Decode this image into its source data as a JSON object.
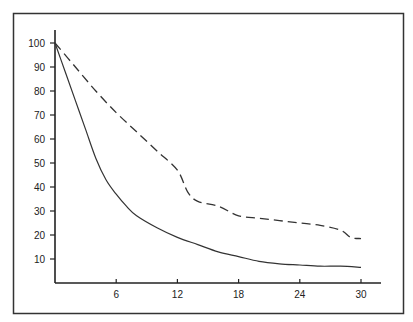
{
  "chart_data": {
    "type": "line",
    "title": "",
    "xlabel": "",
    "ylabel": "",
    "xlim": [
      0,
      31.5
    ],
    "ylim": [
      0,
      105
    ],
    "x_ticks": [
      6,
      12,
      18,
      24,
      30
    ],
    "x_tick_labels": [
      "6",
      "12",
      "18",
      "24",
      "30"
    ],
    "y_ticks": [
      10,
      20,
      30,
      40,
      50,
      60,
      70,
      80,
      90,
      100
    ],
    "y_tick_labels": [
      "10",
      "20",
      "30",
      "40",
      "50",
      "60",
      "70",
      "80",
      "90",
      "100"
    ],
    "grid": false,
    "legend": null,
    "series": [
      {
        "name": "dashed",
        "style": "dashed",
        "x": [
          0,
          2,
          4,
          6,
          8,
          10,
          12,
          13,
          14,
          16,
          18,
          20,
          22,
          24,
          26,
          28,
          29,
          30
        ],
        "y": [
          100,
          90,
          80,
          71,
          63,
          55,
          47,
          38,
          34,
          32,
          28,
          27,
          26,
          25,
          24,
          22,
          19,
          18.5
        ]
      },
      {
        "name": "solid",
        "style": "solid",
        "x": [
          0,
          1,
          2,
          3,
          4,
          5,
          6,
          7,
          8,
          10,
          12,
          14,
          16,
          18,
          20,
          22,
          24,
          26,
          28,
          30
        ],
        "y": [
          100,
          88,
          76,
          64,
          52,
          43,
          37,
          32,
          28,
          23,
          19,
          16,
          13,
          11,
          9,
          8,
          7.5,
          7,
          7,
          6.5
        ]
      }
    ]
  }
}
